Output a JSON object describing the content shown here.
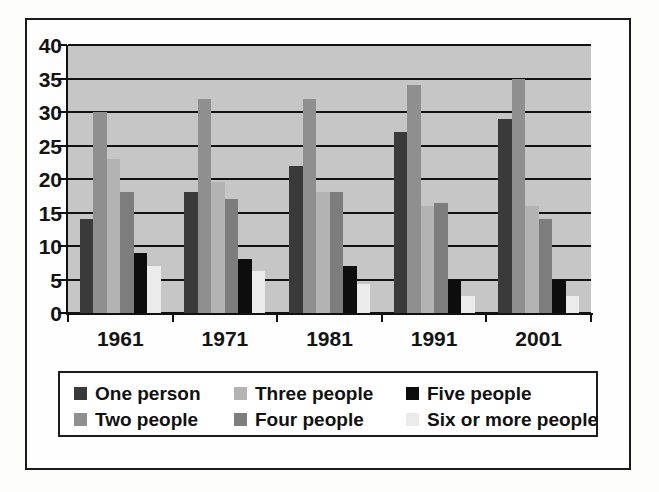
{
  "chart_data": {
    "type": "bar",
    "title": "",
    "xlabel": "",
    "ylabel": "",
    "ylim": [
      0,
      40
    ],
    "ytick_step": 5,
    "yticks": [
      "0",
      "5",
      "10",
      "15",
      "20",
      "25",
      "30",
      "35",
      "40"
    ],
    "grid": true,
    "legend_position": "bottom",
    "categories": [
      "1961",
      "1971",
      "1981",
      "1991",
      "2001"
    ],
    "series": [
      {
        "name": "One person",
        "color": "#3a3a3a",
        "values": [
          14,
          18,
          22,
          27,
          29
        ]
      },
      {
        "name": "Two people",
        "color": "#8f8f8f",
        "values": [
          30,
          32,
          32,
          34,
          35
        ]
      },
      {
        "name": "Three people",
        "color": "#b3b3b3",
        "values": [
          23,
          19.5,
          18,
          16,
          16
        ]
      },
      {
        "name": "Four people",
        "color": "#7d7d7d",
        "values": [
          18,
          17,
          18,
          16.4,
          14
        ]
      },
      {
        "name": "Five people",
        "color": "#0d0d0d",
        "values": [
          9,
          8,
          7,
          5,
          5
        ]
      },
      {
        "name": "Six or more people",
        "color": "#ebebeb",
        "values": [
          7,
          6.3,
          4.3,
          2.5,
          2.5
        ]
      }
    ]
  },
  "style": {
    "plot_background": "#c6c6c6",
    "gridline_color": "#111111",
    "axis_color": "#111111",
    "frame_color": "#1b1b1b",
    "page_background": "#ffffff"
  }
}
